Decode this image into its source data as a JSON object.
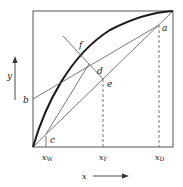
{
  "diagram": {
    "type": "McCabe-Thiele x-y diagram",
    "axes": {
      "x_label": "x",
      "y_label": "y"
    },
    "points": {
      "a": "a",
      "b": "b",
      "c": "c",
      "d": "d",
      "e": "e",
      "f": "f"
    },
    "tick_labels": {
      "xw_main": "x",
      "xw_sub": "W",
      "xf_main": "x",
      "xf_sub": "F",
      "xd_main": "x",
      "xd_sub": "D"
    },
    "colors": {
      "line": "#444444",
      "curve": "#1a1a1a",
      "background": "#ffffff"
    }
  }
}
